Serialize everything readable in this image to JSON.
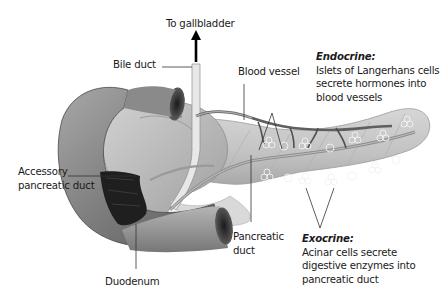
{
  "diagram": {
    "labels": {
      "to_gallbladder": "To gallbladder",
      "bile_duct": "Bile duct",
      "blood_vessel": "Blood vessel",
      "accessory_duct": [
        "Accessory",
        "pancreatic duct"
      ],
      "duodenum": "Duodenum",
      "pancreatic_duct": [
        "Pancreatic",
        "duct"
      ]
    },
    "endocrine": {
      "heading": "Endocrine:",
      "lines": [
        "Islets of Langerhans cells",
        "secrete hormones into",
        "blood vessels"
      ]
    },
    "exocrine": {
      "heading": "Exocrine:",
      "lines": [
        "Acinar cells secrete",
        "digestive enzymes into",
        "pancreatic duct"
      ]
    },
    "colors": {
      "text": "#1a1a1a",
      "leader_line": "#333333",
      "duodenum": "#7a7a7a",
      "pancreas": "#c4c4c4",
      "duct": "#e6e6e6",
      "vessel": "#6b6b6b"
    }
  }
}
